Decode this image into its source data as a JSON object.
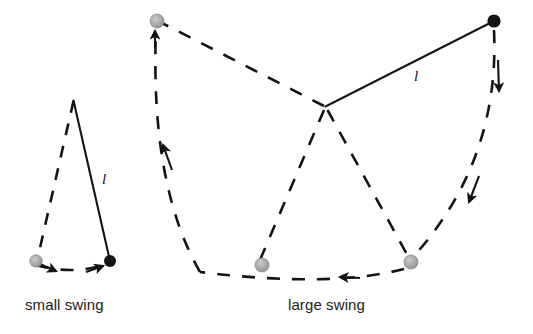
{
  "figure": {
    "background_color": "#ffffff",
    "width": 533,
    "height": 334,
    "ink_color": "#141414",
    "bob_start_color": "#a8a8a8",
    "bob_end_color": "#141414"
  },
  "captions": {
    "small": "small swing",
    "large": "large swing"
  },
  "labels": {
    "length_small": "l",
    "length_large": "l"
  },
  "diagrams": [
    {
      "name": "small-swing",
      "caption": "small swing",
      "pivot": {
        "x": 73,
        "y": 101
      },
      "rod": {
        "style": "solid",
        "from": {
          "x": 73,
          "y": 101
        },
        "to": {
          "x": 110,
          "y": 261
        },
        "length_label": "l"
      },
      "bobs": [
        {
          "role": "start",
          "color": "#a8a8a8",
          "x": 36,
          "y": 262,
          "r": 6
        },
        {
          "role": "end",
          "color": "#141414",
          "x": 110,
          "y": 261,
          "r": 6
        }
      ],
      "arcs": [
        {
          "name": "rise-arc",
          "style": "dashed",
          "from": {
            "x": 36,
            "y": 262
          },
          "to": {
            "x": 73,
            "y": 104
          },
          "direction": "upward"
        },
        {
          "name": "bottom-arc",
          "style": "dashed",
          "from": {
            "x": 36,
            "y": 265
          },
          "to": {
            "x": 110,
            "y": 264
          },
          "direction": "rightward"
        }
      ],
      "arrow_count": 2
    },
    {
      "name": "large-swing",
      "caption": "large swing",
      "pivot": {
        "x": 325,
        "y": 106
      },
      "rod": {
        "style": "solid",
        "from": {
          "x": 325,
          "y": 106
        },
        "to": {
          "x": 494,
          "y": 21
        },
        "length_label": "l"
      },
      "bobs": [
        {
          "role": "start",
          "color": "#a8a8a8",
          "x": 157,
          "y": 21,
          "r": 7
        },
        {
          "role": "end",
          "color": "#141414",
          "x": 494,
          "y": 21,
          "r": 7
        },
        {
          "role": "mid-left",
          "color": "#a8a8a8",
          "x": 262,
          "y": 265,
          "r": 7
        },
        {
          "role": "mid-right",
          "color": "#a8a8a8",
          "x": 411,
          "y": 262,
          "r": 7
        }
      ],
      "arcs": [
        {
          "name": "right-descend-arc",
          "style": "dashed",
          "from": {
            "x": 494,
            "y": 27
          },
          "to": {
            "x": 415,
            "y": 259
          },
          "direction": "downward"
        },
        {
          "name": "bottom-arc",
          "style": "dashed",
          "from": {
            "x": 405,
            "y": 267
          },
          "to": {
            "x": 200,
            "y": 271
          },
          "direction": "leftward"
        },
        {
          "name": "left-ascend-arc",
          "style": "dashed",
          "from": {
            "x": 200,
            "y": 271
          },
          "to": {
            "x": 157,
            "y": 30
          },
          "direction": "upward"
        },
        {
          "name": "rod-extreme-left",
          "style": "dashed",
          "from": {
            "x": 325,
            "y": 110
          },
          "to": {
            "x": 163,
            "y": 26
          },
          "direction": "none"
        },
        {
          "name": "rod-bottom-left",
          "style": "dashed",
          "from": {
            "x": 325,
            "y": 110
          },
          "to": {
            "x": 259,
            "y": 259
          },
          "direction": "none"
        },
        {
          "name": "rod-bottom-right",
          "style": "dashed",
          "from": {
            "x": 328,
            "y": 112
          },
          "to": {
            "x": 407,
            "y": 258
          },
          "direction": "none"
        }
      ],
      "arrow_count": 4
    }
  ]
}
